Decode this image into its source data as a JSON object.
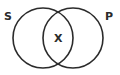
{
  "diagram": {
    "type": "venn",
    "sets": [
      {
        "label": "S",
        "cx": 43,
        "cy": 38,
        "r": 30
      },
      {
        "label": "P",
        "cx": 73,
        "cy": 38,
        "r": 30
      }
    ],
    "labels": {
      "left_set": "S",
      "right_set": "P",
      "intersection": "X"
    },
    "colors": {
      "stroke": "#2b2b2b",
      "text": "#2b2b2b",
      "background": "#ffffff"
    }
  }
}
